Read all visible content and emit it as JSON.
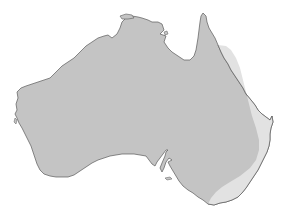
{
  "title": {
    "text": "",
    "note": "Title text cropped off the top edge; only descender fragments visible"
  },
  "map": {
    "region": "Australia (mainland)",
    "projection": "outline map",
    "colors": {
      "background": "#ffffff",
      "mainland_fill": "#c4c4c4",
      "east_coast_band_fill": "#e2e2e2",
      "coastline_stroke": "#666666"
    },
    "regions": [
      {
        "name": "mainland",
        "shade": "medium grey"
      },
      {
        "name": "east-coast-band",
        "shade": "light grey",
        "extent": "Cape York south along Queensland and NSW coast to Victoria"
      }
    ]
  }
}
